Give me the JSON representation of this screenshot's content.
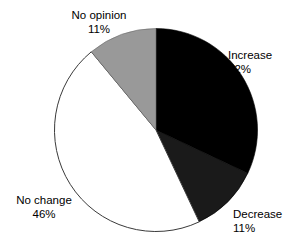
{
  "chart_data": {
    "type": "pie",
    "title": "",
    "subtitle": "",
    "xlabel": "",
    "ylabel": "",
    "legend_position": "none",
    "grid": false,
    "start_angle_deg": 0,
    "direction": "clockwise",
    "categories": [
      "Increase",
      "Decrease",
      "No change",
      "No opinion"
    ],
    "values": [
      32,
      11,
      46,
      11
    ],
    "unit": "%",
    "slices": [
      {
        "label": "Increase",
        "value": 32,
        "value_text": "32%",
        "color": "#000000",
        "stroke": "#000000",
        "start_deg": 0.0,
        "end_deg": 115.2
      },
      {
        "label": "Decrease",
        "value": 11,
        "value_text": "11%",
        "color": "#1a1a1a",
        "stroke": "#000000",
        "start_deg": 115.2,
        "end_deg": 154.8
      },
      {
        "label": "No change",
        "value": 46,
        "value_text": "46%",
        "color": "#ffffff",
        "stroke": "#3a3a3a",
        "start_deg": 154.8,
        "end_deg": 320.4
      },
      {
        "label": "No opinion",
        "value": 11,
        "value_text": "11%",
        "color": "#999999",
        "stroke": "#6a6a6a",
        "start_deg": 320.4,
        "end_deg": 360.0
      }
    ]
  },
  "labels": {
    "no_opinion": {
      "name": "No opinion",
      "value": "11%"
    },
    "increase": {
      "name": "Increase",
      "value": "32%"
    },
    "decrease": {
      "name": "Decrease",
      "value": "11%"
    },
    "no_change": {
      "name": "No change",
      "value": "46%"
    }
  },
  "colors": {
    "background": "#ffffff",
    "text": "#000000",
    "increase": "#000000",
    "decrease": "#1a1a1a",
    "no_change": "#ffffff",
    "no_opinion": "#999999",
    "outline": "#3a3a3a"
  }
}
